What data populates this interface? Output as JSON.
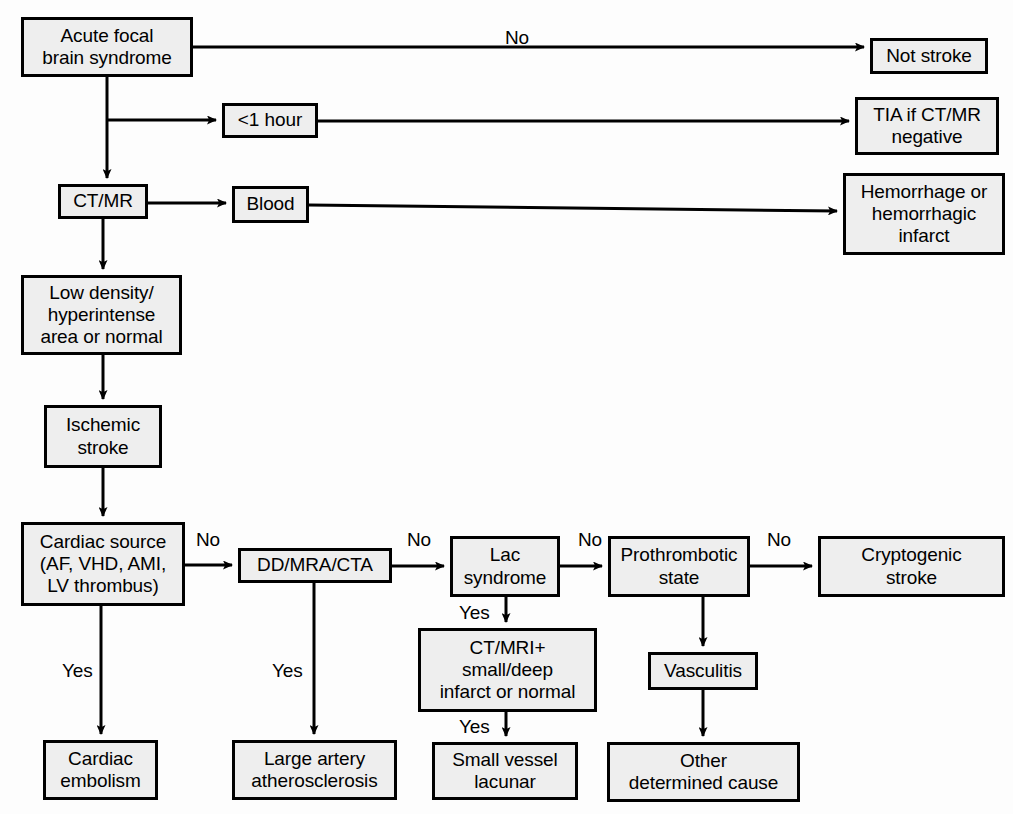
{
  "diagram": {
    "colors": {
      "box_fill": "#eeeeee",
      "box_border": "#000000",
      "line": "#000000",
      "page_background": "#fdfdfd",
      "text": "#000000"
    },
    "nodes": [
      {
        "id": "acute",
        "label": "Acute focal\nbrain syndrome",
        "x": 21,
        "y": 17,
        "w": 172,
        "h": 60
      },
      {
        "id": "not_stroke",
        "label": "Not stroke",
        "x": 870,
        "y": 38,
        "w": 118,
        "h": 36
      },
      {
        "id": "one_hour",
        "label": "<1 hour",
        "x": 222,
        "y": 103,
        "w": 96,
        "h": 35
      },
      {
        "id": "tia",
        "label": "TIA if CT/MR\nnegative",
        "x": 855,
        "y": 97,
        "w": 144,
        "h": 58
      },
      {
        "id": "ctmr",
        "label": "CT/MR",
        "x": 58,
        "y": 184,
        "w": 90,
        "h": 35
      },
      {
        "id": "blood",
        "label": "Blood",
        "x": 232,
        "y": 186,
        "w": 77,
        "h": 37
      },
      {
        "id": "hemorrhage",
        "label": "Hemorrhage or\nhemorrhagic\ninfarct",
        "x": 843,
        "y": 173,
        "w": 162,
        "h": 82
      },
      {
        "id": "lowdensity",
        "label": "Low density/\nhyperintense\narea or normal",
        "x": 21,
        "y": 275,
        "w": 161,
        "h": 80
      },
      {
        "id": "ischemic",
        "label": "Ischemic\nstroke",
        "x": 44,
        "y": 405,
        "w": 118,
        "h": 63
      },
      {
        "id": "cardiac_src",
        "label": "Cardiac source\n(AF, VHD, AMI,\nLV thrombus)",
        "x": 21,
        "y": 522,
        "w": 164,
        "h": 84
      },
      {
        "id": "ddmracta",
        "label": "DD/MRA/CTA",
        "x": 238,
        "y": 548,
        "w": 154,
        "h": 35
      },
      {
        "id": "lac",
        "label": "Lac\nsyndrome",
        "x": 450,
        "y": 536,
        "w": 110,
        "h": 61
      },
      {
        "id": "prothrombotic",
        "label": "Prothrombotic\nstate",
        "x": 608,
        "y": 536,
        "w": 142,
        "h": 61
      },
      {
        "id": "cryptogenic",
        "label": "Cryptogenic\nstroke",
        "x": 818,
        "y": 536,
        "w": 187,
        "h": 61
      },
      {
        "id": "ctmri_plus",
        "label": "CT/MRI+\nsmall/deep\ninfarct or normal",
        "x": 418,
        "y": 628,
        "w": 179,
        "h": 84
      },
      {
        "id": "vasculitis",
        "label": "Vasculitis",
        "x": 648,
        "y": 652,
        "w": 110,
        "h": 38
      },
      {
        "id": "cardiac_emb",
        "label": "Cardiac\nembolism",
        "x": 43,
        "y": 740,
        "w": 115,
        "h": 60
      },
      {
        "id": "large_artery",
        "label": "Large artery\natherosclerosis",
        "x": 232,
        "y": 740,
        "w": 165,
        "h": 60
      },
      {
        "id": "small_vessel",
        "label": "Small vessel\nlacunar",
        "x": 432,
        "y": 742,
        "w": 146,
        "h": 58
      },
      {
        "id": "other_cause",
        "label": "Other\ndetermined cause",
        "x": 607,
        "y": 742,
        "w": 193,
        "h": 60
      }
    ],
    "edge_labels": [
      {
        "id": "no_acute_notstroke",
        "text": "No",
        "x": 505,
        "y": 27
      },
      {
        "id": "no_cardiac_dd",
        "text": "No",
        "x": 196,
        "y": 529
      },
      {
        "id": "no_dd_lac",
        "text": "No",
        "x": 407,
        "y": 529
      },
      {
        "id": "no_lac_pro",
        "text": "No",
        "x": 578,
        "y": 529
      },
      {
        "id": "no_pro_crypto",
        "text": "No",
        "x": 767,
        "y": 529
      },
      {
        "id": "yes_cardiac",
        "text": "Yes",
        "x": 62,
        "y": 660
      },
      {
        "id": "yes_dd",
        "text": "Yes",
        "x": 272,
        "y": 660
      },
      {
        "id": "yes_lac",
        "text": "Yes",
        "x": 459,
        "y": 602
      },
      {
        "id": "yes_ctmri",
        "text": "Yes",
        "x": 459,
        "y": 716
      }
    ]
  }
}
